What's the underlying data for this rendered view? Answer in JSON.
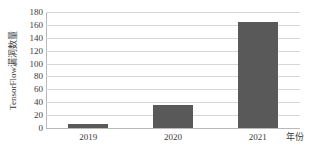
{
  "chart_data": {
    "type": "bar",
    "title": "",
    "subtitle": "",
    "categories": [
      "2019",
      "2020",
      "2021"
    ],
    "values": [
      6,
      36,
      164
    ],
    "xlabel": "年份",
    "ylabel": "TensorFlow漏洞数量",
    "ylim": [
      0,
      180
    ],
    "yticks": [
      0,
      20,
      40,
      60,
      80,
      100,
      120,
      140,
      160,
      180
    ],
    "ytick_labels": [
      "0",
      "20",
      "40",
      "60",
      "80",
      "100",
      "120",
      "140",
      "160",
      "180"
    ],
    "grid": "horizontal",
    "legend": "none",
    "annotations": [],
    "colors": {
      "bar": "#595959",
      "gridline": "#d6d6d6",
      "axis": "#b9b9b9",
      "text": "#3a3a3a",
      "background": "#ffffff"
    }
  }
}
